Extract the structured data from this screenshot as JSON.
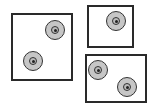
{
  "diagram": {
    "colors": {
      "border": "#2a2a2a",
      "disc_fill": "#c6c6c6",
      "disc_stroke": "#333333",
      "background": "#ffffff"
    },
    "boxes": [
      {
        "id": "left",
        "x": 11,
        "y": 13,
        "w": 62,
        "h": 68,
        "discs": [
          {
            "cx": 55,
            "cy": 30
          },
          {
            "cx": 33,
            "cy": 61
          }
        ]
      },
      {
        "id": "top-right",
        "x": 87,
        "y": 5,
        "w": 47,
        "h": 43,
        "discs": [
          {
            "cx": 116,
            "cy": 21
          }
        ]
      },
      {
        "id": "bottom-right",
        "x": 85,
        "y": 54,
        "w": 62,
        "h": 49,
        "discs": [
          {
            "cx": 98,
            "cy": 70
          },
          {
            "cx": 127,
            "cy": 87
          }
        ]
      }
    ],
    "disc_counts": [
      2,
      1,
      2
    ]
  }
}
